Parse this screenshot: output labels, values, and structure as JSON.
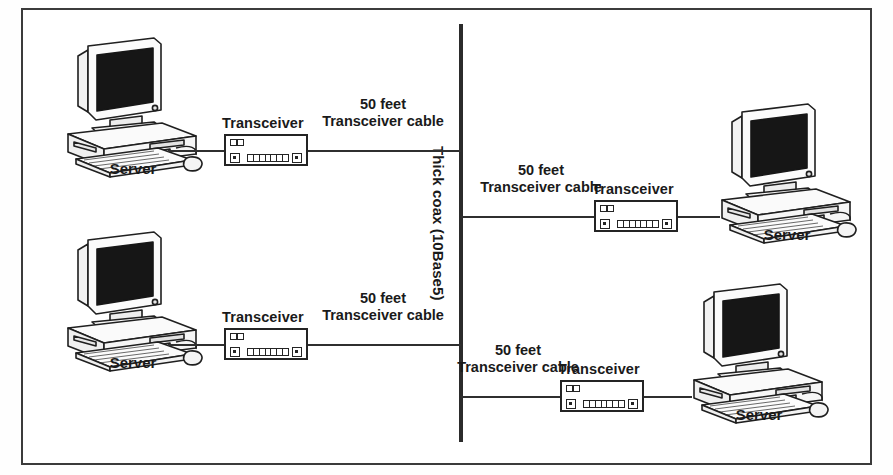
{
  "figure": {
    "margin_text": "Networking",
    "background_color": "#ffffff",
    "line_color": "#2b2b2b"
  },
  "backbone": {
    "name": "thick-coax-backbone",
    "label": "Thick coax (10Base5)",
    "orientation": "vertical"
  },
  "segments": [
    {
      "id": "top-left",
      "feet": "50 feet",
      "cable_type": "Transceiver cable",
      "transceiver_label": "Transceiver",
      "host_label": "Server"
    },
    {
      "id": "top-right",
      "feet": "50 feet",
      "cable_type": "Transceiver cable",
      "transceiver_label": "Transceiver",
      "host_label": "Server"
    },
    {
      "id": "bottom-left",
      "feet": "50 feet",
      "cable_type": "Transceiver cable",
      "transceiver_label": "Transceiver",
      "host_label": "Server"
    },
    {
      "id": "bottom-right",
      "feet": "50 feet",
      "cable_type": "Transceiver cable",
      "transceiver_label": "Transceiver",
      "host_label": "Server"
    }
  ]
}
